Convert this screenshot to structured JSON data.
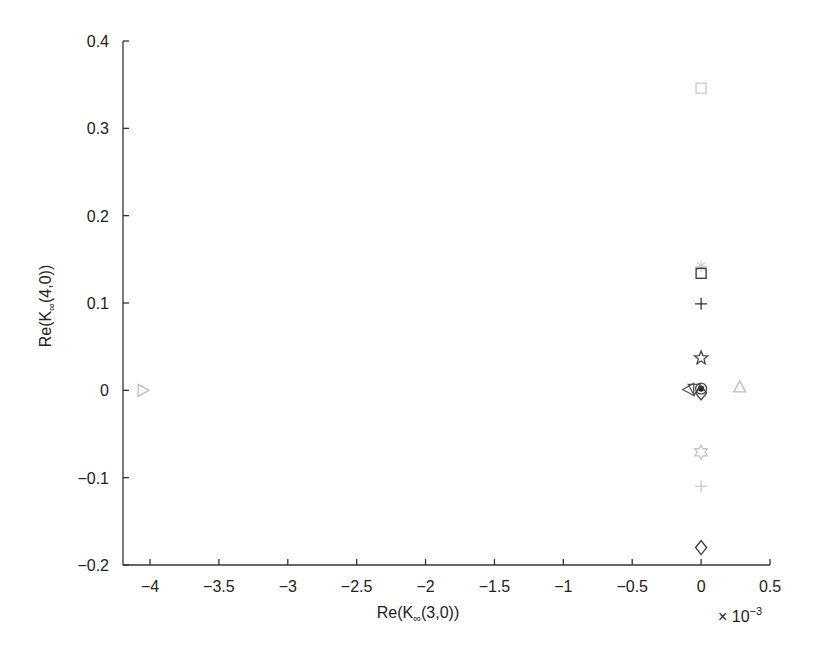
{
  "chart_data": {
    "type": "scatter",
    "title": "",
    "xlabel": "Re(K∞(3,0))",
    "ylabel": "Re(K∞(4,0))",
    "xlabel_parts": {
      "prefix": "Re(K",
      "sub": "∞",
      "suffix": "(3,0))"
    },
    "ylabel_parts": {
      "prefix": "Re(K",
      "sub": "∞",
      "suffix": "(4,0))"
    },
    "x_multiplier": {
      "base": "× 10",
      "exp": "−3"
    },
    "xlim": [
      -4.13,
      0.5
    ],
    "ylim": [
      -0.2,
      0.4
    ],
    "x_scale": 0.001,
    "x_ticks": [
      -4,
      -3.5,
      -3,
      -2.5,
      -2,
      -1.5,
      -1,
      -0.5,
      0,
      0.5
    ],
    "x_tick_labels": [
      "−4",
      "−3.5",
      "−3",
      "−2.5",
      "−2",
      "−1.5",
      "−1",
      "−0.5",
      "0",
      "0.5"
    ],
    "y_ticks": [
      0.4,
      0.3,
      0.2,
      0.1,
      0,
      -0.1,
      -0.2
    ],
    "y_tick_labels": [
      "0.4",
      "0.3",
      "0.2",
      "0.1",
      "0",
      "−0.1",
      "−0.2"
    ],
    "grid": false,
    "legend": null,
    "points": [
      {
        "marker": "square",
        "color": "#c8c8c8",
        "x": 0.0,
        "y": 0.346
      },
      {
        "marker": "asterisk",
        "color": "#d0d0d0",
        "x": 0.0,
        "y": 0.142
      },
      {
        "marker": "square",
        "color": "#333333",
        "x": 0.0,
        "y": 0.134
      },
      {
        "marker": "plus",
        "color": "#333333",
        "x": 0.0,
        "y": 0.099
      },
      {
        "marker": "pentagram",
        "color": "#444444",
        "x": 0.0,
        "y": 0.037
      },
      {
        "marker": "triangle-left",
        "color": "#555555",
        "x": -0.09,
        "y": 0.001
      },
      {
        "marker": "triangle-down",
        "color": "#555555",
        "x": -0.05,
        "y": 0.001
      },
      {
        "marker": "circle",
        "color": "#444444",
        "x": 0.0,
        "y": 0.002
      },
      {
        "marker": "dot",
        "color": "#222222",
        "x": 0.0,
        "y": 0.002
      },
      {
        "marker": "diamond",
        "color": "#444444",
        "x": 0.0,
        "y": -0.003
      },
      {
        "marker": "triangle-up",
        "color": "#bdbdbd",
        "x": 0.28,
        "y": 0.004
      },
      {
        "marker": "triangle-right",
        "color": "#bdbdbd",
        "x": -4.05,
        "y": 0.0
      },
      {
        "marker": "hexagram",
        "color": "#c0c0c0",
        "x": 0.0,
        "y": -0.071
      },
      {
        "marker": "plus",
        "color": "#c8c8c8",
        "x": 0.0,
        "y": -0.11
      },
      {
        "marker": "diamond",
        "color": "#333333",
        "x": 0.0,
        "y": -0.18
      }
    ]
  },
  "layout": {
    "plot_left": 123,
    "plot_right": 770,
    "plot_top": 41,
    "plot_bottom": 565,
    "x_px_at_minus4": 150,
    "x_px_at_0_5": 770
  }
}
